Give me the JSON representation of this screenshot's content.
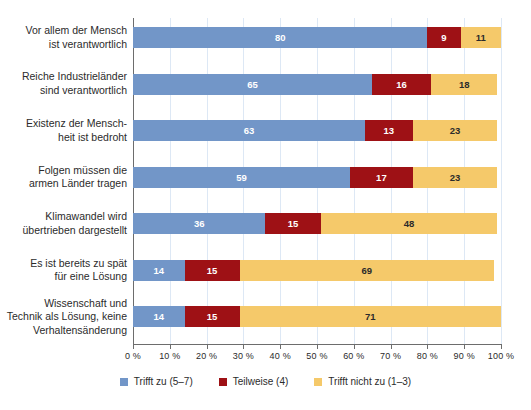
{
  "chart_data": {
    "type": "bar",
    "orientation": "horizontal",
    "stacked": true,
    "title": "",
    "subtitle": "",
    "xlabel": "",
    "ylabel": "",
    "xlim": [
      0,
      100
    ],
    "grid": true,
    "legend_position": "bottom",
    "categories": [
      "Vor allem der Mensch\nist verantwortlich",
      "Reiche Industrieländer\nsind verantwortlich",
      "Existenz der Mensch-\nheit ist bedroht",
      "Folgen müssen die\narmen Länder tragen",
      "Klimawandel wird\nübertrieben dargestellt",
      "Es ist bereits zu spät\nfür eine Lösung",
      "Wissenschaft und\nTechnik als Lösung, keine\nVerhaltensänderung"
    ],
    "series": [
      {
        "name": "Trifft zu (5–7)",
        "color": "#7296c8",
        "values": [
          80,
          65,
          63,
          59,
          36,
          14,
          14
        ]
      },
      {
        "name": "Teilweise (4)",
        "color": "#9e1115",
        "values": [
          9,
          16,
          13,
          17,
          15,
          15,
          15
        ]
      },
      {
        "name": "Trifft nicht zu (1–3)",
        "color": "#f5c96a",
        "values": [
          11,
          18,
          23,
          23,
          48,
          69,
          71
        ]
      }
    ],
    "xticks": [
      0,
      10,
      20,
      30,
      40,
      50,
      60,
      70,
      80,
      90,
      100
    ],
    "xticklabels": [
      "0 %",
      "10 %",
      "20 %",
      "30 %",
      "40 %",
      "50 %",
      "60 %",
      "70 %",
      "80 %",
      "90 %",
      "100 %"
    ]
  },
  "legend": {
    "items": [
      {
        "label": "Trifft zu (5–7)"
      },
      {
        "label": "Teilweise (4)"
      },
      {
        "label": "Trifft nicht zu (1–3)"
      }
    ]
  },
  "colors": {
    "series_a": "#7296c8",
    "series_b": "#9e1115",
    "series_c": "#f5c96a",
    "gridline": "#dde8f5",
    "axis": "#6d6d6d",
    "text": "#2b2b2b",
    "background": "#ffffff"
  }
}
